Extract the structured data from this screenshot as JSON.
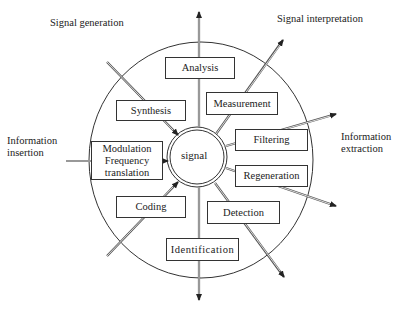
{
  "diagram": {
    "center_label": "signal",
    "corner_labels": {
      "top_left": "Signal generation",
      "top_right": "Signal interpretation",
      "left": "Information\ninsertion",
      "right": "Information\nextraction"
    },
    "boxes": [
      {
        "id": "analysis",
        "label": "Analysis"
      },
      {
        "id": "synthesis",
        "label": "Synthesis"
      },
      {
        "id": "measurement",
        "label": "Measurement"
      },
      {
        "id": "filtering",
        "label": "Filtering"
      },
      {
        "id": "modulation",
        "label": "Modulation\nFrequency\ntranslation"
      },
      {
        "id": "regeneration",
        "label": "Regeneration"
      },
      {
        "id": "coding",
        "label": "Coding"
      },
      {
        "id": "detection",
        "label": "Detection"
      },
      {
        "id": "identification",
        "label": "Identification"
      }
    ],
    "colors": {
      "line": "#333333",
      "background": "#ffffff"
    }
  }
}
